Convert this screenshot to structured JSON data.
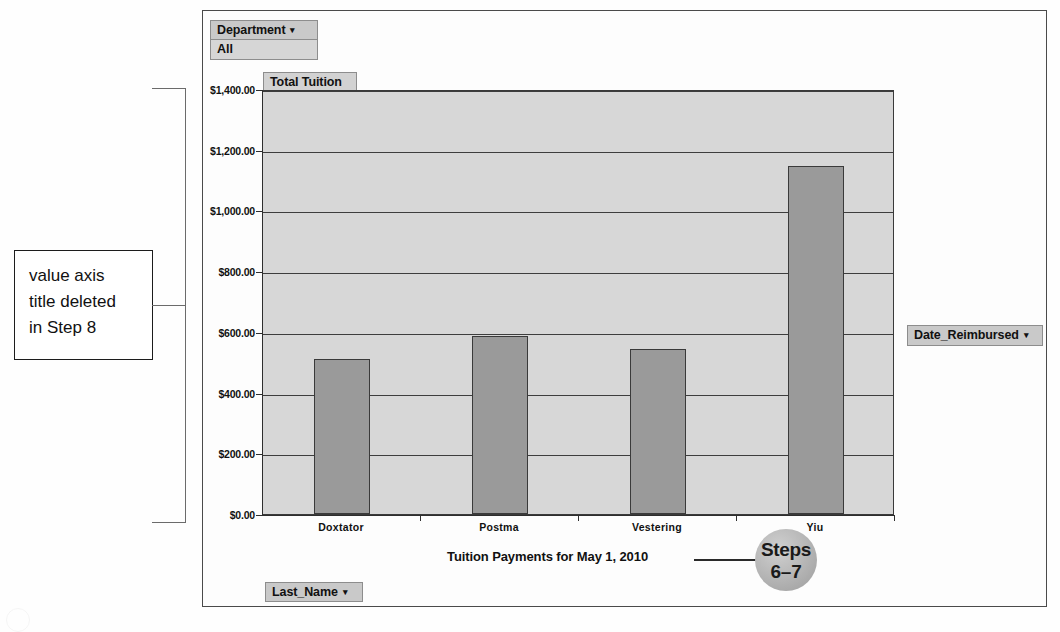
{
  "chart_data": {
    "type": "bar",
    "title": "Tuition Payments for May 1, 2010",
    "xlabel": "",
    "ylabel": "",
    "categories": [
      "Doxtator",
      "Postma",
      "Vestering",
      "Yiu"
    ],
    "values": [
      510,
      585,
      545,
      1145
    ],
    "series": [
      {
        "name": "Total Tuition",
        "values": [
          510,
          585,
          545,
          1145
        ]
      }
    ],
    "ylim": [
      0,
      1400
    ],
    "ytick_values": [
      0,
      200,
      400,
      600,
      800,
      1000,
      1200,
      1400
    ],
    "ytick_labels": [
      "$0.00",
      "$200.00",
      "$400.00",
      "$600.00",
      "$800.00",
      "$1,000.00",
      "$1,200.00",
      "$1,400.00"
    ],
    "grid": true,
    "legend": false,
    "bar_color": "#9a9a9a",
    "plot_background": "#d7d7d7"
  },
  "pivot": {
    "department_field": "Department",
    "department_value": "All",
    "value_field": "Total Tuition",
    "page_field": "Date_Reimbursed",
    "category_field": "Last_Name",
    "caret": "▾"
  },
  "annotations": {
    "callout_lines": [
      "value axis",
      "title deleted",
      "in Step 8"
    ],
    "steps_badge_word": "Steps",
    "steps_badge_number": "6–7"
  }
}
